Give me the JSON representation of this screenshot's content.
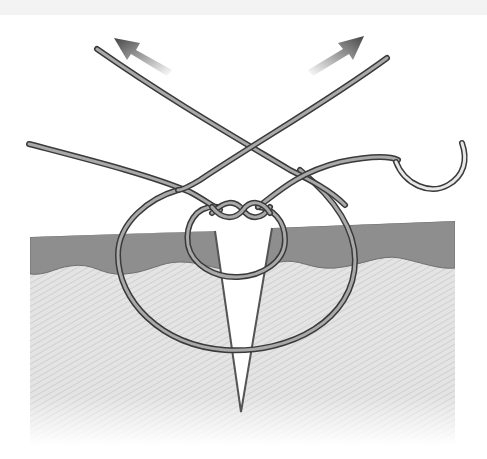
{
  "figure": {
    "elements": {
      "skin_epidermis": "dark gray epidermis layer",
      "skin_dermis": "light hatched dermis / subcutaneous tissue",
      "wound": "V-shaped incision",
      "knot": "twisted knot above incision",
      "inner_loop": "small suture loop through wound edges",
      "outer_loop": "large suture loop deep under wound",
      "needle": "curved suture needle",
      "arrow_left": "pull direction up-left",
      "arrow_right": "pull direction up-right"
    }
  },
  "colors": {
    "background": "#ffffff",
    "top_strip": "#f3f3f3",
    "epidermis": "#8e8e8e",
    "epidermis_edge": "#6a6a6a",
    "dermis": "#e2e2e2",
    "dermis_hatch": "#cfcfcf",
    "thread_outline": "#3a3a3a",
    "thread_fill": "#a9a9a9",
    "wound_line": "#555555",
    "arrow": "#555555"
  }
}
